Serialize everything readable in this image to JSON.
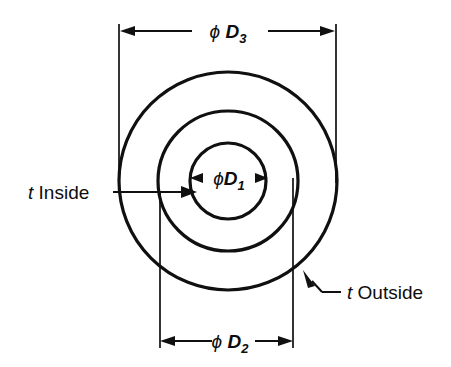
{
  "figure": {
    "background_color": "#ffffff",
    "line_color": "#101010"
  },
  "dimensions": {
    "outer_diameter": {
      "id": "phi-d3",
      "symbol": "ϕ",
      "variable": "D",
      "subscript": "3",
      "full_label": "ϕ D3",
      "position": "top"
    },
    "middle_diameter": {
      "id": "phi-d2",
      "symbol": "ϕ",
      "variable": "D",
      "subscript": "2",
      "full_label": "ϕ D2",
      "position": "bottom"
    },
    "inner_diameter": {
      "id": "phi-d1",
      "symbol": "ϕ",
      "variable": "D",
      "subscript": "1",
      "full_label": "ϕ D1",
      "position": "center"
    }
  },
  "callouts": {
    "inside": {
      "id": "t-inside",
      "italic_part": "t",
      "plain_part": "Inside",
      "full_label": "t Inside",
      "position": "left"
    },
    "outside": {
      "id": "t-outside",
      "italic_part": "t",
      "plain_part": "Outside",
      "full_label": "t Outside",
      "position": "bottom-right"
    }
  },
  "geometry": {
    "center_x": 228,
    "center_y": 181,
    "outer_radius": 109,
    "middle_radius": 70,
    "inner_radius": 38
  }
}
